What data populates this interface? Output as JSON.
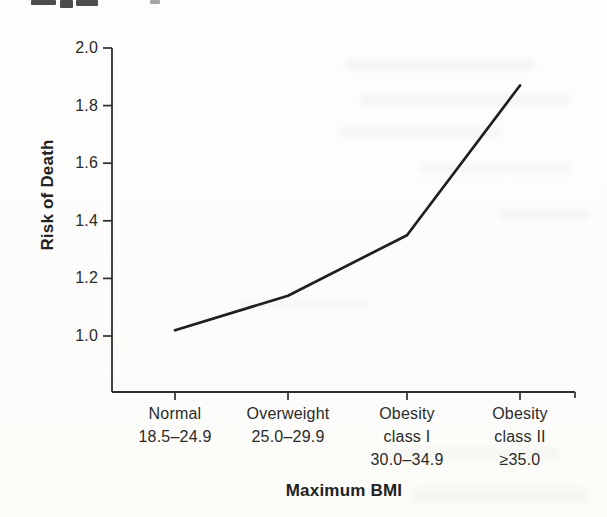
{
  "chart_data": {
    "type": "line",
    "title": "",
    "xlabel": "Maximum BMI",
    "ylabel": "Risk of Death",
    "categories": [
      {
        "label_lines": [
          "Normal",
          "18.5–24.9"
        ]
      },
      {
        "label_lines": [
          "Overweight",
          "25.0–29.9"
        ]
      },
      {
        "label_lines": [
          "Obesity",
          "class I",
          "30.0–34.9"
        ]
      },
      {
        "label_lines": [
          "Obesity",
          "class II",
          "≥35.0"
        ]
      }
    ],
    "series": [
      {
        "name": "Risk of Death",
        "values": [
          1.02,
          1.14,
          1.35,
          1.87
        ]
      }
    ],
    "y_ticks": [
      2.0,
      1.8,
      1.6,
      1.4,
      1.2,
      1.0
    ],
    "y_tick_labels": [
      "2.0",
      "1.8",
      "1.6",
      "1.4",
      "1.2",
      "1.0"
    ],
    "ylim": [
      0.81,
      2.0
    ],
    "grid": false,
    "legend_position": "none",
    "line_color": "#1f1f1f",
    "axis_color": "#2e2e2e",
    "text_color": "#2b2b2b",
    "background_color": "#fcfcfa"
  }
}
